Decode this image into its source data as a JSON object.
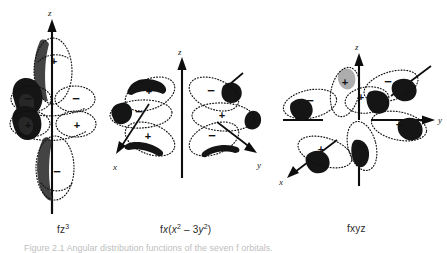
{
  "figure": {
    "background_color": "#ffffff",
    "ink_color": "#111111",
    "caption": "Figure 2.1  Angular distribution functions of the seven f orbitals.",
    "panels": [
      {
        "id": "fz3",
        "label": "fz3",
        "label_base": "fz",
        "label_sup": "3",
        "orbital_name": "f z-cubed orbital",
        "axes": [
          {
            "name": "z",
            "label": "z",
            "direction": "up"
          }
        ],
        "lobes": [
          {
            "sign": "+",
            "position": "top-lobe"
          },
          {
            "sign": "−",
            "position": "upper-left-torus"
          },
          {
            "sign": "−",
            "position": "upper-right-torus"
          },
          {
            "sign": "+",
            "position": "lower-left-torus"
          },
          {
            "sign": "+",
            "position": "lower-right-torus"
          },
          {
            "sign": "−",
            "position": "bottom-lobe"
          }
        ]
      },
      {
        "id": "fx_x2_3y2",
        "label": "fx(x2 - 3y2)",
        "label_parts": {
          "prefix": "f",
          "var1": "x",
          "open": "(",
          "var2": "x",
          "sup2": "2",
          "operator": " – 3",
          "var3": "y",
          "sup3": "2",
          "close": ")"
        },
        "orbital_name": "f x(x-squared minus 3 y-squared) orbital",
        "axes": [
          {
            "name": "z",
            "label": "z",
            "direction": "up"
          },
          {
            "name": "y",
            "label": "y",
            "direction": "down-right"
          },
          {
            "name": "x",
            "label": "x",
            "direction": "down-left"
          }
        ],
        "lobes": [
          {
            "sign": "+",
            "position": "upper-left"
          },
          {
            "sign": "−",
            "position": "upper-right"
          },
          {
            "sign": "−",
            "position": "mid-left"
          },
          {
            "sign": "+",
            "position": "mid-right"
          },
          {
            "sign": "+",
            "position": "lower-left"
          },
          {
            "sign": "−",
            "position": "lower-right"
          }
        ]
      },
      {
        "id": "fxyz",
        "label": "fxyz",
        "orbital_name": "f xyz orbital",
        "axes": [
          {
            "name": "z",
            "label": "z",
            "direction": "up"
          },
          {
            "name": "y",
            "label": "y",
            "direction": "right"
          },
          {
            "name": "x",
            "label": "x",
            "direction": "down-left"
          }
        ],
        "lobes": [
          {
            "sign": "+",
            "position": "upper-near-left"
          },
          {
            "sign": "−",
            "position": "upper-right"
          },
          {
            "sign": "−",
            "position": "mid-far-left"
          },
          {
            "sign": "+",
            "position": "center-upper"
          },
          {
            "sign": "+",
            "position": "mid-right"
          },
          {
            "sign": "+",
            "position": "lower-left"
          },
          {
            "sign": "−",
            "position": "lower-center"
          }
        ]
      }
    ]
  }
}
